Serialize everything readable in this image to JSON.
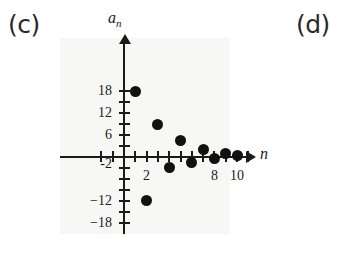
{
  "panels": {
    "left_label": "(c)",
    "right_label": "(d)"
  },
  "chart_data": {
    "type": "scatter",
    "title": "",
    "subtitle": "",
    "xlabel": "n",
    "ylabel": "a_n",
    "ylabel_display": "a",
    "ylabel_sub": "n",
    "grid": false,
    "legend": null,
    "xlim": [
      -3,
      12
    ],
    "ylim": [
      -21,
      21
    ],
    "xticks": [
      -2,
      -1,
      1,
      2,
      3,
      4,
      5,
      6,
      7,
      8,
      9,
      10,
      11
    ],
    "yticks": [
      -18,
      -15,
      -12,
      -9,
      -6,
      -3,
      3,
      6,
      9,
      12,
      15,
      18
    ],
    "xtick_labels": [
      {
        "value": 2,
        "text": "2"
      },
      {
        "value": 8,
        "text": "8"
      },
      {
        "value": 10,
        "text": "10"
      }
    ],
    "ytick_labels": [
      {
        "value": 18,
        "text": "18"
      },
      {
        "value": 12,
        "text": "12"
      },
      {
        "value": 6,
        "text": "6"
      },
      {
        "value": -2,
        "text": "-2"
      },
      {
        "value": -12,
        "text": "−12"
      },
      {
        "value": -18,
        "text": "−18"
      }
    ],
    "x": [
      1,
      2,
      3,
      4,
      5,
      6,
      7,
      8,
      9,
      10
    ],
    "values": [
      18,
      -12,
      9,
      -3,
      4.5,
      -1.5,
      2,
      -0.5,
      1,
      0.5
    ],
    "points": [
      {
        "n": 1,
        "a": 18
      },
      {
        "n": 2,
        "a": -12
      },
      {
        "n": 3,
        "a": 9
      },
      {
        "n": 4,
        "a": -3
      },
      {
        "n": 5,
        "a": 4.5
      },
      {
        "n": 6,
        "a": -1.5
      },
      {
        "n": 7,
        "a": 2
      },
      {
        "n": 8,
        "a": -0.5
      },
      {
        "n": 9,
        "a": 1
      },
      {
        "n": 10,
        "a": 0.5
      }
    ],
    "marker": "filled-circle",
    "marker_color": "#111111",
    "background": "#f7f7f5"
  }
}
